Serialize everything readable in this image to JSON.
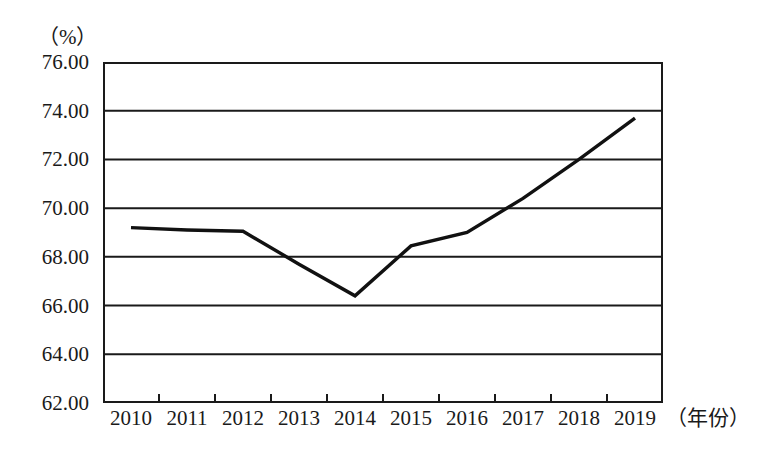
{
  "chart_data": {
    "type": "line",
    "title": "",
    "subtitle": "",
    "unit_label": "（%）",
    "xlabel": "（年份）",
    "ylabel": "",
    "categories": [
      "2010",
      "2011",
      "2012",
      "2013",
      "2014",
      "2015",
      "2016",
      "2017",
      "2018",
      "2019"
    ],
    "x": [
      2010,
      2011,
      2012,
      2013,
      2014,
      2015,
      2016,
      2017,
      2018,
      2019
    ],
    "values": [
      69.2,
      69.1,
      69.05,
      67.7,
      66.4,
      68.45,
      69.0,
      70.4,
      72.0,
      73.7
    ],
    "series": [
      {
        "name": "",
        "values": [
          69.2,
          69.1,
          69.05,
          67.7,
          66.4,
          68.45,
          69.0,
          70.4,
          72.0,
          73.7
        ]
      }
    ],
    "ylim": [
      62.0,
      76.0
    ],
    "ytick_labels": [
      "76.00",
      "74.00",
      "72.00",
      "70.00",
      "68.00",
      "66.00",
      "64.00",
      "62.00"
    ],
    "ytick_values": [
      76.0,
      74.0,
      72.0,
      70.0,
      68.0,
      66.0,
      64.0,
      62.0
    ],
    "xtick_labels": [
      "2010",
      "2011",
      "2012",
      "2013",
      "2014",
      "2015",
      "2016",
      "2017",
      "2018",
      "2019"
    ],
    "grid": "horizontal",
    "legend": "none",
    "line_color": "#111111",
    "axis_color": "#1a1a1a",
    "background_color": "#ffffff",
    "annotations": []
  }
}
